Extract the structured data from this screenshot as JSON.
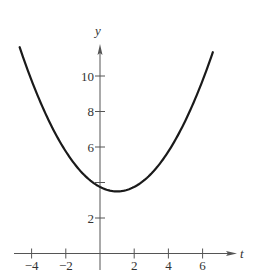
{
  "chart_data": {
    "type": "line",
    "title": "",
    "xlabel": "t",
    "ylabel": "y",
    "xlim": [
      -4.7,
      6.6
    ],
    "ylim": [
      0,
      11.5
    ],
    "grid": false,
    "x_ticks": [
      -4,
      -2,
      2,
      4,
      6
    ],
    "x_tick_labels": [
      "−4",
      "−2",
      "2",
      "4",
      "6"
    ],
    "y_ticks": [
      2,
      4,
      6,
      8,
      10
    ],
    "y_tick_labels": [
      "2",
      "",
      "6",
      "8",
      "10"
    ],
    "series": [
      {
        "name": "curve",
        "color": "#1a1a1a",
        "x": [
          -4.7,
          -4,
          -3,
          -2,
          -1,
          0,
          1,
          2,
          3,
          4,
          5,
          6,
          6.6
        ],
        "y": [
          11.6,
          9.75,
          7.5,
          5.75,
          4.5,
          3.75,
          3.5,
          3.75,
          4.5,
          5.75,
          7.5,
          9.75,
          11.3
        ]
      }
    ]
  },
  "colors": {
    "axis": "#555555",
    "curve": "#1a1a1a",
    "text": "#333333"
  }
}
